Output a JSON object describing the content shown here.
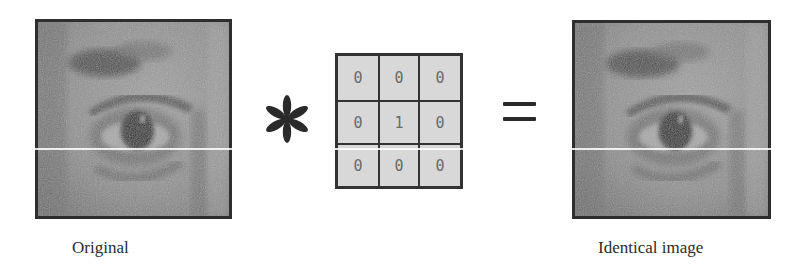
{
  "figure": {
    "input_image": {
      "caption": "Original",
      "subject": "close-up of a human eye (grayscale)"
    },
    "operator_convolution": "*",
    "kernel": {
      "rows": [
        [
          "0",
          "0",
          "0"
        ],
        [
          "0",
          "1",
          "0"
        ],
        [
          "0",
          "0",
          "0"
        ]
      ]
    },
    "operator_equals": "=",
    "output_image": {
      "caption": "Identical image",
      "subject": "close-up of a human eye (grayscale)"
    }
  },
  "colors": {
    "frame": "#2e2e2e",
    "kernel_fill": "#d8d8d8",
    "kernel_digit": "#6a6a6a",
    "text": "#2b2b2b"
  }
}
